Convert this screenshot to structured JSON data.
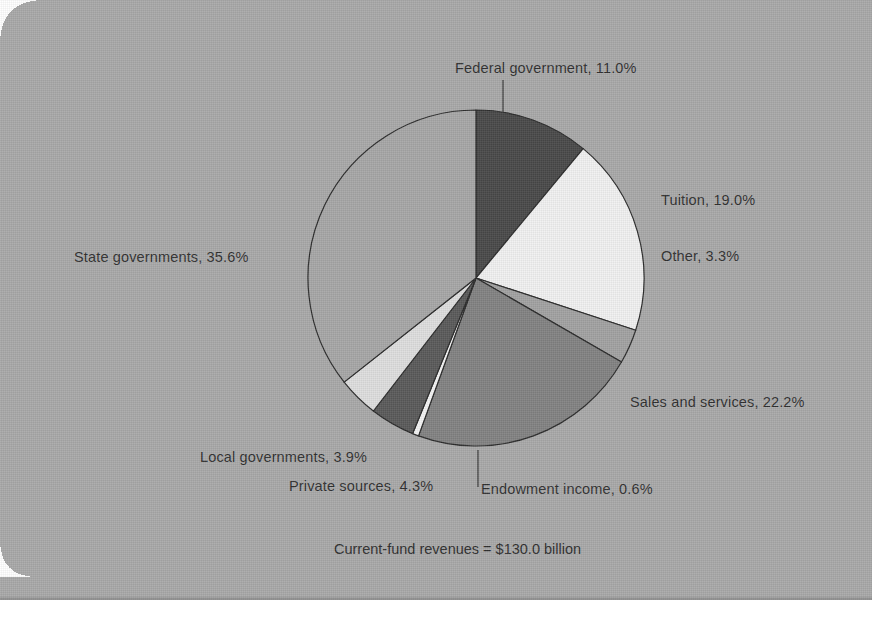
{
  "figure": {
    "caption": "Current-fund revenues = $130.0 billion",
    "background_color": "#a9a9a9"
  },
  "chart_data": {
    "type": "pie",
    "title": "",
    "subtitle": "",
    "caption": "Current-fund revenues = $130.0 billion",
    "total_label": "Current-fund revenues = $130.0 billion",
    "total_value": 130.0,
    "total_units": "billion USD",
    "units": "percent",
    "start_angle_deg": 0,
    "direction": "clockwise",
    "legend": "none",
    "labels_position": "outside-with-leader-lines",
    "categories": [
      "Federal government",
      "Tuition",
      "Other",
      "Sales and services",
      "Endowment income",
      "Private sources",
      "Local governments",
      "State governments"
    ],
    "values": [
      11.0,
      19.0,
      3.3,
      22.2,
      0.6,
      4.3,
      3.9,
      35.6
    ],
    "slices": [
      {
        "label": "Federal government",
        "value": 11.0,
        "display": "Federal government, 11.0%",
        "color": "#494949"
      },
      {
        "label": "Tuition",
        "value": 19.0,
        "display": "Tuition, 19.0%",
        "color": "#f1f1f1"
      },
      {
        "label": "Other",
        "value": 3.3,
        "display": "Other, 3.3%",
        "color": "#a2a2a2"
      },
      {
        "label": "Sales and services",
        "value": 22.2,
        "display": "Sales and services, 22.2%",
        "color": "#828282"
      },
      {
        "label": "Endowment income",
        "value": 0.6,
        "display": "Endowment income, 0.6%",
        "color": "#f4f4f4"
      },
      {
        "label": "Private sources",
        "value": 4.3,
        "display": "Private sources, 4.3%",
        "color": "#5a5a5a"
      },
      {
        "label": "Local governments",
        "value": 3.9,
        "display": "Local governments, 3.9%",
        "color": "#dedede"
      },
      {
        "label": "State governments",
        "value": 35.6,
        "display": "State governments, 35.6%",
        "color": "#a7a7a7"
      }
    ]
  },
  "labels": {
    "federal_government": "Federal government, 11.0%",
    "tuition": "Tuition, 19.0%",
    "other": "Other, 3.3%",
    "sales_and_services": "Sales and services, 22.2%",
    "endowment_income": "Endowment income, 0.6%",
    "private_sources": "Private sources, 4.3%",
    "local_governments": "Local governments, 3.9%",
    "state_governments": "State governments, 35.6%"
  }
}
